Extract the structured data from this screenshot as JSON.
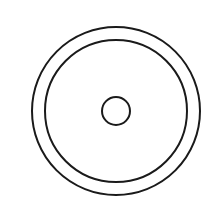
{
  "diagram": {
    "type": "concentric-circles",
    "background": "#ffffff",
    "stroke_color": "#1a1a1a",
    "stroke_width": 2,
    "center": {
      "x": 116,
      "y": 111
    },
    "circles": [
      {
        "name": "outer-ring",
        "r": 84
      },
      {
        "name": "inner-ring",
        "r": 71
      },
      {
        "name": "center-hole",
        "r": 14
      }
    ]
  }
}
